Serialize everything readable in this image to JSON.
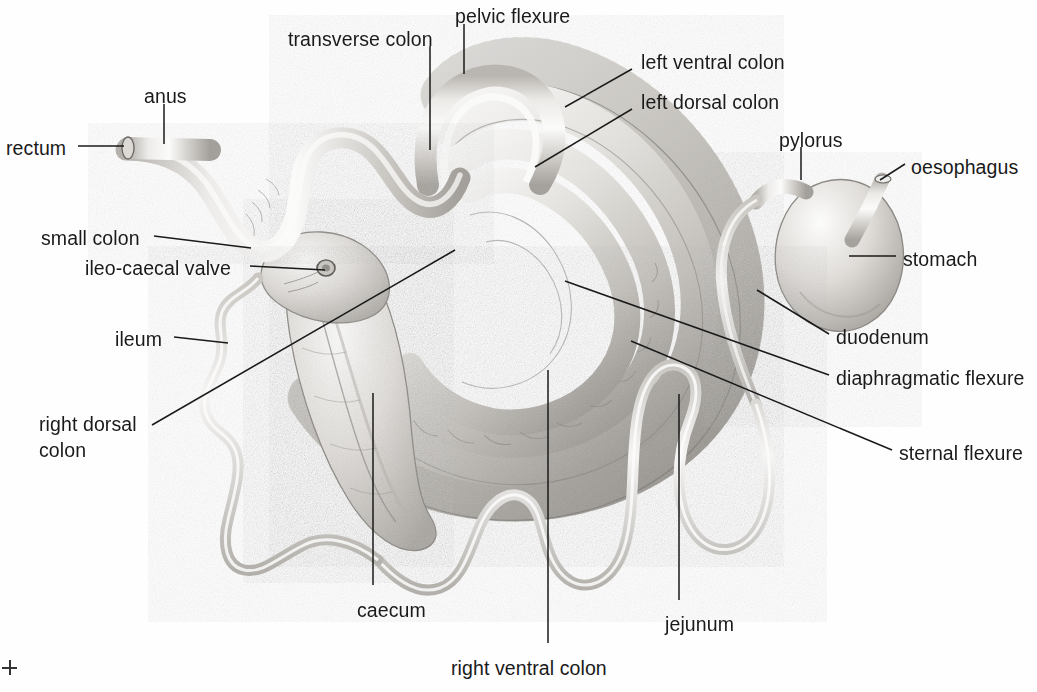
{
  "figure": {
    "style": "pencil/stipple line drawing, greyscale",
    "background_color": "#fefefe",
    "ink_color": "#1a1a1a",
    "organ_fill_light": "#f2f1ef",
    "organ_fill_mid": "#cfcdc9",
    "organ_shadow": "#9b9894"
  },
  "labels": [
    {
      "id": "rectum",
      "text": "rectum",
      "x": 6,
      "y": 137,
      "align": "left"
    },
    {
      "id": "anus",
      "text": "anus",
      "x": 144,
      "y": 85,
      "align": "left"
    },
    {
      "id": "transverse-colon",
      "text": "transverse colon",
      "x": 288,
      "y": 28,
      "align": "left"
    },
    {
      "id": "pelvic-flexure",
      "text": "pelvic flexure",
      "x": 455,
      "y": 5,
      "align": "left"
    },
    {
      "id": "left-ventral-colon",
      "text": "left ventral colon",
      "x": 641,
      "y": 51,
      "align": "left"
    },
    {
      "id": "left-dorsal-colon",
      "text": "left dorsal colon",
      "x": 641,
      "y": 91,
      "align": "left"
    },
    {
      "id": "pylorus",
      "text": "pylorus",
      "x": 779,
      "y": 129,
      "align": "left"
    },
    {
      "id": "oesophagus",
      "text": "oesophagus",
      "x": 911,
      "y": 156,
      "align": "left"
    },
    {
      "id": "stomach",
      "text": "stomach",
      "x": 903,
      "y": 248,
      "align": "left"
    },
    {
      "id": "duodenum",
      "text": "duodenum",
      "x": 836,
      "y": 326,
      "align": "left"
    },
    {
      "id": "diaphragmatic-flexure",
      "text": "diaphragmatic flexure",
      "x": 836,
      "y": 367,
      "align": "left"
    },
    {
      "id": "sternal-flexure",
      "text": "sternal flexure",
      "x": 899,
      "y": 442,
      "align": "left"
    },
    {
      "id": "small-colon",
      "text": "small colon",
      "x": 41,
      "y": 227,
      "align": "left"
    },
    {
      "id": "ileo-caecal-valve",
      "text": "ileo-caecal valve",
      "x": 85,
      "y": 257,
      "align": "left"
    },
    {
      "id": "ileum",
      "text": "ileum",
      "x": 115,
      "y": 328,
      "align": "left"
    },
    {
      "id": "right-dorsal-colon",
      "text": "right dorsal\ncolon",
      "x": 39,
      "y": 411,
      "align": "left"
    },
    {
      "id": "caecum",
      "text": "caecum",
      "x": 357,
      "y": 599,
      "align": "left"
    },
    {
      "id": "jejunum",
      "text": "jejunum",
      "x": 665,
      "y": 613,
      "align": "left"
    },
    {
      "id": "right-ventral-colon",
      "text": "right ventral colon",
      "x": 451,
      "y": 657,
      "align": "left"
    }
  ],
  "leader_lines": [
    {
      "id": "rectum",
      "points": "78,146 124,146"
    },
    {
      "id": "anus",
      "points": "164,104 164,144"
    },
    {
      "id": "transverse-colon",
      "points": "430,46 430,150"
    },
    {
      "id": "pelvic-flexure",
      "points": "464,24 464,74"
    },
    {
      "id": "left-ventral-colon",
      "points": "565,107 632,69"
    },
    {
      "id": "left-dorsal-colon",
      "points": "535,167 632,109"
    },
    {
      "id": "pylorus",
      "points": "801,147 801,180"
    },
    {
      "id": "oesophagus",
      "points": "880,180 905,164"
    },
    {
      "id": "stomach",
      "points": "849,256 896,256"
    },
    {
      "id": "duodenum",
      "points": "757,290 829,334"
    },
    {
      "id": "diaphragmatic-flexure",
      "points": "565,281 829,375"
    },
    {
      "id": "sternal-flexure",
      "points": "631,341 892,450"
    },
    {
      "id": "small-colon",
      "points": "154,236 251,248"
    },
    {
      "id": "ileo-caecal-valve",
      "points": "250,266 325,270"
    },
    {
      "id": "ileum",
      "points": "174,337 228,343"
    },
    {
      "id": "right-dorsal-colon",
      "points": "152,425 455,250"
    },
    {
      "id": "caecum",
      "points": "373,393 373,585"
    },
    {
      "id": "jejunum",
      "points": "679,394 679,600"
    },
    {
      "id": "right-ventral-colon",
      "points": "548,370 548,643"
    }
  ],
  "crop_mark": {
    "x": 2,
    "y": 660,
    "visible": true
  }
}
